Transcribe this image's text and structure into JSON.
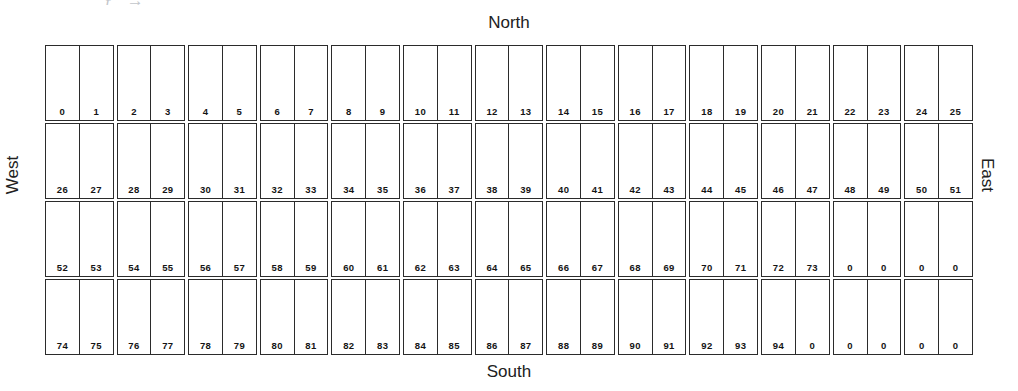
{
  "document": {
    "type": "parking-bay-layout-diagram",
    "scrap_text": "’ ƒ   →",
    "rows_count": 4,
    "pairs_per_row": 13,
    "cells_per_row": 26,
    "total_cells": 104
  },
  "compass": {
    "north": "North",
    "south": "South",
    "west": "West",
    "east": "East"
  },
  "colors": {
    "stroke": "#2b2b2b",
    "text": "#141414",
    "background": "#ffffff",
    "scrap": "#b9bcc2"
  },
  "grid": {
    "rows": [
      {
        "index": 0,
        "cells": [
          "0",
          "1",
          "2",
          "3",
          "4",
          "5",
          "6",
          "7",
          "8",
          "9",
          "10",
          "11",
          "12",
          "13",
          "14",
          "15",
          "16",
          "17",
          "18",
          "19",
          "20",
          "21",
          "22",
          "23",
          "24",
          "25"
        ]
      },
      {
        "index": 1,
        "cells": [
          "26",
          "27",
          "28",
          "29",
          "30",
          "31",
          "32",
          "33",
          "34",
          "35",
          "36",
          "37",
          "38",
          "39",
          "40",
          "41",
          "42",
          "43",
          "44",
          "45",
          "46",
          "47",
          "48",
          "49",
          "50",
          "51"
        ]
      },
      {
        "index": 2,
        "cells": [
          "52",
          "53",
          "54",
          "55",
          "56",
          "57",
          "58",
          "59",
          "60",
          "61",
          "62",
          "63",
          "64",
          "65",
          "66",
          "67",
          "68",
          "69",
          "70",
          "71",
          "72",
          "73",
          "0",
          "0",
          "0",
          "0"
        ]
      },
      {
        "index": 3,
        "cells": [
          "74",
          "75",
          "76",
          "77",
          "78",
          "79",
          "80",
          "81",
          "82",
          "83",
          "84",
          "85",
          "86",
          "87",
          "88",
          "89",
          "90",
          "91",
          "92",
          "93",
          "94",
          "0",
          "0",
          "0",
          "0",
          "0"
        ]
      }
    ]
  }
}
